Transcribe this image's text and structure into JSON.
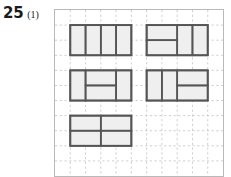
{
  "label": {
    "number": "25",
    "sub": "(1)"
  },
  "colors": {
    "grid_line": "#c8c8c8",
    "frame_border": "#b9b9b9",
    "shape_fill": "#efefef",
    "shape_stroke": "#555555",
    "text": "#1a1a1a",
    "page_background": "#ffffff"
  },
  "grid": {
    "cols": 11,
    "rows": 11,
    "cell_px": 15.45,
    "line_style": "dashed",
    "frame_width_px": 170,
    "frame_height_px": 168,
    "frame_left_px": 54,
    "frame_top_px": 9
  },
  "chart_data": {
    "type": "diagram",
    "xlabel": "",
    "ylabel": "",
    "grid": "dashed light gray, 11 x 11 cells",
    "legend": "none",
    "shapes": [
      {
        "id": "shape-1",
        "name": "four-vertical-dominoes",
        "origin_cell": [
          1,
          1
        ],
        "width_cells": 4,
        "height_cells": 2,
        "pieces": [
          {
            "x": 0,
            "y": 0,
            "w": 1,
            "h": 2
          },
          {
            "x": 1,
            "y": 0,
            "w": 1,
            "h": 2
          },
          {
            "x": 2,
            "y": 0,
            "w": 1,
            "h": 2
          },
          {
            "x": 3,
            "y": 0,
            "w": 1,
            "h": 2
          }
        ]
      },
      {
        "id": "shape-2",
        "name": "two-horizontal-left-two-vertical-right",
        "origin_cell": [
          6,
          1
        ],
        "width_cells": 4,
        "height_cells": 2,
        "pieces": [
          {
            "x": 0,
            "y": 0,
            "w": 2,
            "h": 1
          },
          {
            "x": 0,
            "y": 1,
            "w": 2,
            "h": 1
          },
          {
            "x": 2,
            "y": 0,
            "w": 1,
            "h": 2
          },
          {
            "x": 3,
            "y": 0,
            "w": 1,
            "h": 2
          }
        ]
      },
      {
        "id": "shape-3",
        "name": "vertical-two-horizontal-middle-vertical",
        "origin_cell": [
          1,
          4
        ],
        "width_cells": 4,
        "height_cells": 2,
        "pieces": [
          {
            "x": 0,
            "y": 0,
            "w": 1,
            "h": 2
          },
          {
            "x": 1,
            "y": 0,
            "w": 2,
            "h": 1
          },
          {
            "x": 1,
            "y": 1,
            "w": 2,
            "h": 1
          },
          {
            "x": 3,
            "y": 0,
            "w": 1,
            "h": 2
          }
        ]
      },
      {
        "id": "shape-4",
        "name": "two-vertical-left-two-horizontal-right",
        "origin_cell": [
          6,
          4
        ],
        "width_cells": 4,
        "height_cells": 2,
        "pieces": [
          {
            "x": 0,
            "y": 0,
            "w": 1,
            "h": 2
          },
          {
            "x": 1,
            "y": 0,
            "w": 1,
            "h": 2
          },
          {
            "x": 2,
            "y": 0,
            "w": 2,
            "h": 1
          },
          {
            "x": 2,
            "y": 1,
            "w": 2,
            "h": 1
          }
        ]
      },
      {
        "id": "shape-5",
        "name": "four-horizontal-dominoes",
        "origin_cell": [
          1,
          7
        ],
        "width_cells": 4,
        "height_cells": 2,
        "pieces": [
          {
            "x": 0,
            "y": 0,
            "w": 2,
            "h": 1
          },
          {
            "x": 2,
            "y": 0,
            "w": 2,
            "h": 1
          },
          {
            "x": 0,
            "y": 1,
            "w": 2,
            "h": 1
          },
          {
            "x": 2,
            "y": 1,
            "w": 2,
            "h": 1
          }
        ]
      }
    ]
  }
}
